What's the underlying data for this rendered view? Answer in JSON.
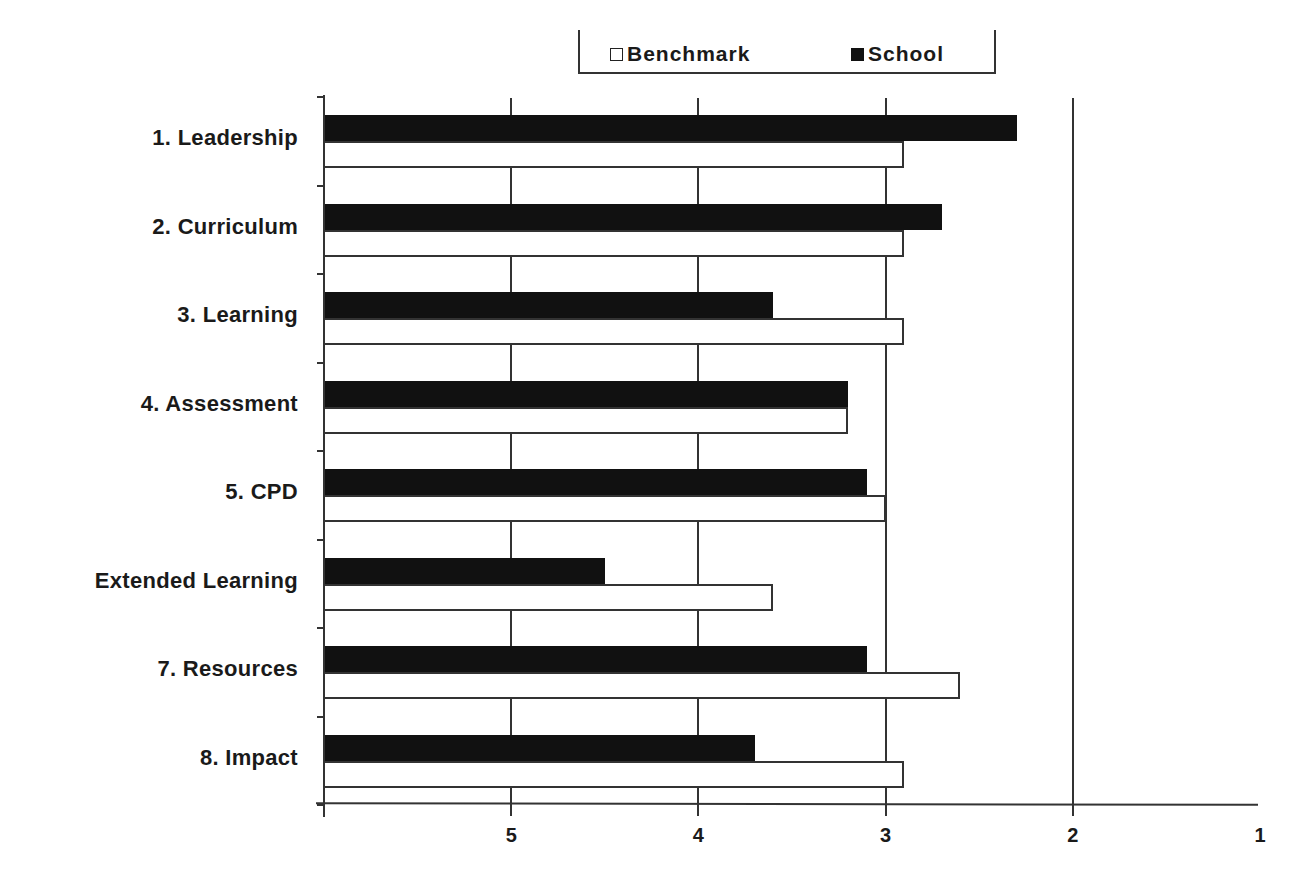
{
  "chart_data": {
    "type": "bar",
    "orientation": "horizontal",
    "title": "",
    "xlabel": "",
    "ylabel": "",
    "x_axis": {
      "reversed": true,
      "range": [
        6,
        1
      ],
      "ticks": [
        5,
        4,
        3,
        2,
        1
      ]
    },
    "grid": {
      "vertical": true,
      "horizontal": false
    },
    "legend": {
      "position": "top",
      "entries": [
        "Benchmark",
        "School"
      ]
    },
    "categories": [
      "1. Leadership",
      "2. Curriculum",
      "3. Learning",
      "4. Assessment",
      "5. CPD",
      "Extended Learning",
      "7. Resources",
      "8. Impact"
    ],
    "series": [
      {
        "name": "School",
        "color": "#111111",
        "values": [
          2.3,
          2.7,
          3.6,
          3.2,
          3.1,
          4.5,
          3.1,
          3.7
        ]
      },
      {
        "name": "Benchmark",
        "color": "#ffffff",
        "values": [
          2.9,
          2.9,
          2.9,
          3.2,
          3.0,
          3.6,
          2.6,
          2.9
        ]
      }
    ]
  },
  "legend": {
    "benchmark_label": "Benchmark",
    "school_label": "School"
  },
  "axis": {
    "tick_labels": [
      "5",
      "4",
      "3",
      "2",
      "1"
    ]
  }
}
